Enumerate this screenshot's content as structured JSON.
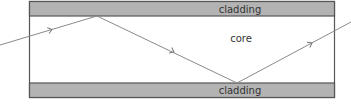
{
  "diagram": {
    "title": "",
    "labels": {
      "top_cladding": "cladding",
      "core": "core",
      "bottom_cladding": "cladding"
    },
    "colors": {
      "cladding_fill": "#b3b3b3",
      "border": "#555555",
      "ray": "#8a8a8a",
      "core_fill": "#ffffff"
    },
    "ray_points": [
      [
        0,
        45
      ],
      [
        97,
        16
      ],
      [
        237,
        83
      ],
      [
        351,
        22
      ]
    ],
    "arrows": [
      {
        "x": 52,
        "y": 29.5,
        "angle": -16.6
      },
      {
        "x": 174,
        "y": 52,
        "angle": 25.6
      },
      {
        "x": 312,
        "y": 43,
        "angle": -28.2
      }
    ]
  }
}
